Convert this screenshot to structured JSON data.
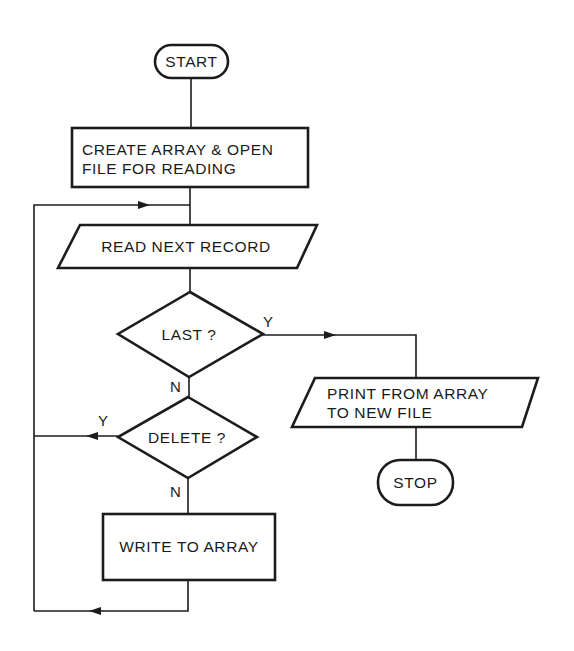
{
  "diagram": {
    "type": "flowchart",
    "colors": {
      "line": "#1c1c1c",
      "text": "#1a1a1a",
      "background": "#ffffff"
    },
    "nodes": {
      "start": {
        "shape": "terminal",
        "label": "START"
      },
      "create": {
        "shape": "process",
        "lines": [
          "CREATE ARRAY & OPEN",
          "FILE FOR READING"
        ]
      },
      "read": {
        "shape": "input-output",
        "label": "READ NEXT RECORD"
      },
      "last": {
        "shape": "decision",
        "label": "LAST ?"
      },
      "delete": {
        "shape": "decision",
        "label": "DELETE ?"
      },
      "write": {
        "shape": "process",
        "label": "WRITE TO ARRAY"
      },
      "print": {
        "shape": "input-output",
        "lines": [
          "PRINT FROM ARRAY",
          "TO NEW FILE"
        ]
      },
      "stop": {
        "shape": "terminal",
        "label": "STOP"
      }
    },
    "edges": [
      {
        "from": "start",
        "to": "create",
        "label": ""
      },
      {
        "from": "create",
        "to": "read",
        "label": ""
      },
      {
        "from": "read",
        "to": "last",
        "label": ""
      },
      {
        "from": "last",
        "to": "print",
        "label": "Y"
      },
      {
        "from": "last",
        "to": "delete",
        "label": "N"
      },
      {
        "from": "delete",
        "to": "read",
        "label": "Y"
      },
      {
        "from": "delete",
        "to": "write",
        "label": "N"
      },
      {
        "from": "write",
        "to": "read",
        "label": ""
      },
      {
        "from": "print",
        "to": "stop",
        "label": ""
      }
    ],
    "branch_labels": {
      "last_yes": "Y",
      "last_no": "N",
      "delete_yes": "Y",
      "delete_no": "N"
    }
  }
}
